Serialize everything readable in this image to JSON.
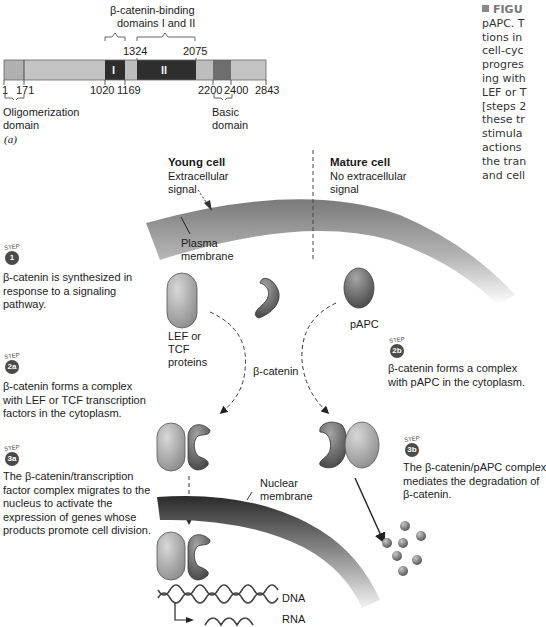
{
  "figure": {
    "panel_label": "(a)",
    "caption_lines": [
      "FIGU",
      "pAPC. T",
      "tions in",
      "cell-cyc",
      "progres",
      "ing with",
      "LEF or T",
      "[steps 2",
      "these tr",
      "stimula",
      "actions",
      "the tran",
      "and cell"
    ]
  },
  "domain_map": {
    "binding_label_line1": "β-catenin-binding",
    "binding_label_line2": "domains I and II",
    "positions": {
      "p1": "1",
      "p171": "171",
      "p1020": "1020",
      "p1169": "1169",
      "p1324": "1324",
      "p2075": "2075",
      "p2200": "2200",
      "p2400": "2400",
      "p2843": "2843"
    },
    "segments": [
      {
        "name": "oligomerization",
        "start": 1,
        "end": 171,
        "color": "#b0b0b0"
      },
      {
        "name": "linker-1",
        "start": 171,
        "end": 1020,
        "color": "#c4c4c4"
      },
      {
        "name": "domain-I",
        "start": 1020,
        "end": 1169,
        "color": "#2e2e2e",
        "label": "I"
      },
      {
        "name": "linker-2",
        "start": 1169,
        "end": 1324,
        "color": "#bdbdbd"
      },
      {
        "name": "domain-II",
        "start": 1324,
        "end": 2075,
        "color": "#2e2e2e",
        "label": "II"
      },
      {
        "name": "linker-3",
        "start": 2075,
        "end": 2200,
        "color": "#bdbdbd"
      },
      {
        "name": "basic",
        "start": 2200,
        "end": 2400,
        "color": "#6e6e6e"
      },
      {
        "name": "c-term",
        "start": 2400,
        "end": 2843,
        "color": "#c4c4c4"
      }
    ],
    "oligomerization_line1": "Oligomerization",
    "oligomerization_line2": "domain",
    "basic_line1": "Basic",
    "basic_line2": "domain"
  },
  "pathway": {
    "young_cell_title": "Young cell",
    "young_cell_sub1": "Extracellular",
    "young_cell_sub2": "signal",
    "mature_cell_title": "Mature cell",
    "mature_cell_sub1": "No extracellular",
    "mature_cell_sub2": "signal",
    "plasma_membrane_line1": "Plasma",
    "plasma_membrane_line2": "membrane",
    "nuclear_membrane_line1": "Nuclear",
    "nuclear_membrane_line2": "membrane",
    "lef_line1": "LEF or",
    "lef_line2": "TCF",
    "lef_line3": "proteins",
    "beta_catenin": "β-catenin",
    "papc": "pAPC",
    "dna": "DNA",
    "rna": "RNA"
  },
  "steps": [
    {
      "id": "1",
      "badge": "1",
      "lines": [
        "β-catenin is synthesized in",
        "response to a signaling",
        "pathway."
      ]
    },
    {
      "id": "2a",
      "badge": "2a",
      "lines": [
        "β-catenin forms a complex",
        "with LEF or TCF transcription",
        "factors in the cytoplasm."
      ]
    },
    {
      "id": "3a",
      "badge": "3a",
      "lines": [
        "The β-catenin/transcription",
        "factor complex migrates to the",
        "nucleus to activate the",
        "expression of genes whose",
        "products promote cell division."
      ]
    },
    {
      "id": "2b",
      "badge": "2b",
      "lines": [
        "β-catenin forms a complex",
        "with pAPC in the cytoplasm."
      ]
    },
    {
      "id": "3b",
      "badge": "3b",
      "lines": [
        "The β-catenin/pAPC complex",
        "mediates the degradation of",
        "β-catenin."
      ]
    }
  ],
  "step_word": "STEP",
  "colors": {
    "dark_domain": "#2e2e2e",
    "light_domain": "#c4c4c4",
    "badge": "#4a4a4a",
    "membrane": "#8a8a8a"
  }
}
